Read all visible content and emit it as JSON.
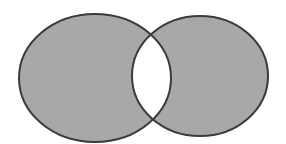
{
  "diagram": {
    "type": "venn",
    "sets": [
      {
        "name": "A",
        "shaded": true
      },
      {
        "name": "B",
        "shaded": true
      }
    ],
    "intersection": {
      "shaded": false
    },
    "colors": {
      "fill": "#a8a8a8",
      "stroke": "#3a3a3a",
      "intersection": "#ffffff",
      "background": "#ffffff"
    }
  }
}
